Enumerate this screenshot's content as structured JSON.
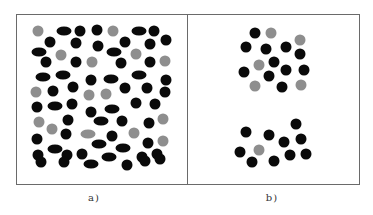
{
  "figure": {
    "frame": {
      "x": 16,
      "y": 14,
      "width": 344,
      "height": 171
    },
    "divider_x": 187,
    "colors": {
      "black": "#0a0a0a",
      "gray": "#8e8e8e",
      "frame": "#6a6a6a"
    },
    "panels": [
      {
        "id": "a",
        "caption": "a)",
        "caption_x": 94,
        "particles": [
          {
            "t": "c",
            "c": "gray",
            "x": 38,
            "y": 31
          },
          {
            "t": "e",
            "c": "black",
            "x": 64,
            "y": 31
          },
          {
            "t": "c",
            "c": "black",
            "x": 80,
            "y": 31
          },
          {
            "t": "c",
            "c": "black",
            "x": 97,
            "y": 30
          },
          {
            "t": "c",
            "c": "gray",
            "x": 113,
            "y": 31
          },
          {
            "t": "e",
            "c": "black",
            "x": 139,
            "y": 31
          },
          {
            "t": "c",
            "c": "black",
            "x": 154,
            "y": 31
          },
          {
            "t": "c",
            "c": "black",
            "x": 50,
            "y": 42
          },
          {
            "t": "c",
            "c": "black",
            "x": 76,
            "y": 43
          },
          {
            "t": "c",
            "c": "black",
            "x": 98,
            "y": 46
          },
          {
            "t": "c",
            "c": "black",
            "x": 125,
            "y": 42
          },
          {
            "t": "c",
            "c": "black",
            "x": 150,
            "y": 44
          },
          {
            "t": "c",
            "c": "black",
            "x": 166,
            "y": 40
          },
          {
            "t": "e",
            "c": "black",
            "x": 39,
            "y": 52
          },
          {
            "t": "c",
            "c": "gray",
            "x": 61,
            "y": 55
          },
          {
            "t": "e",
            "c": "black",
            "x": 114,
            "y": 52
          },
          {
            "t": "c",
            "c": "gray",
            "x": 136,
            "y": 54
          },
          {
            "t": "c",
            "c": "black",
            "x": 46,
            "y": 62
          },
          {
            "t": "c",
            "c": "black",
            "x": 76,
            "y": 62
          },
          {
            "t": "c",
            "c": "gray",
            "x": 92,
            "y": 62
          },
          {
            "t": "c",
            "c": "black",
            "x": 121,
            "y": 63
          },
          {
            "t": "c",
            "c": "black",
            "x": 150,
            "y": 62
          },
          {
            "t": "c",
            "c": "gray",
            "x": 165,
            "y": 61
          },
          {
            "t": "e",
            "c": "black",
            "x": 43,
            "y": 77
          },
          {
            "t": "e",
            "c": "black",
            "x": 63,
            "y": 75
          },
          {
            "t": "c",
            "c": "black",
            "x": 91,
            "y": 80
          },
          {
            "t": "e",
            "c": "black",
            "x": 111,
            "y": 79
          },
          {
            "t": "e",
            "c": "black",
            "x": 139,
            "y": 75
          },
          {
            "t": "c",
            "c": "black",
            "x": 166,
            "y": 80
          },
          {
            "t": "c",
            "c": "gray",
            "x": 36,
            "y": 92
          },
          {
            "t": "c",
            "c": "black",
            "x": 53,
            "y": 91
          },
          {
            "t": "c",
            "c": "black",
            "x": 73,
            "y": 87
          },
          {
            "t": "c",
            "c": "gray",
            "x": 89,
            "y": 95
          },
          {
            "t": "c",
            "c": "gray",
            "x": 106,
            "y": 94
          },
          {
            "t": "c",
            "c": "black",
            "x": 125,
            "y": 88
          },
          {
            "t": "c",
            "c": "black",
            "x": 147,
            "y": 88
          },
          {
            "t": "c",
            "c": "black",
            "x": 37,
            "y": 107
          },
          {
            "t": "e",
            "c": "black",
            "x": 55,
            "y": 106
          },
          {
            "t": "c",
            "c": "black",
            "x": 72,
            "y": 104
          },
          {
            "t": "c",
            "c": "black",
            "x": 91,
            "y": 112
          },
          {
            "t": "e",
            "c": "black",
            "x": 112,
            "y": 109
          },
          {
            "t": "c",
            "c": "black",
            "x": 136,
            "y": 103
          },
          {
            "t": "c",
            "c": "black",
            "x": 155,
            "y": 104
          },
          {
            "t": "c",
            "c": "black",
            "x": 165,
            "y": 92
          },
          {
            "t": "c",
            "c": "gray",
            "x": 39,
            "y": 122
          },
          {
            "t": "c",
            "c": "black",
            "x": 68,
            "y": 120
          },
          {
            "t": "e",
            "c": "black",
            "x": 101,
            "y": 121
          },
          {
            "t": "c",
            "c": "black",
            "x": 122,
            "y": 121
          },
          {
            "t": "c",
            "c": "black",
            "x": 149,
            "y": 123
          },
          {
            "t": "c",
            "c": "gray",
            "x": 163,
            "y": 119
          },
          {
            "t": "c",
            "c": "black",
            "x": 37,
            "y": 139
          },
          {
            "t": "c",
            "c": "gray",
            "x": 52,
            "y": 129
          },
          {
            "t": "c",
            "c": "black",
            "x": 66,
            "y": 134
          },
          {
            "t": "e",
            "c": "gray",
            "x": 88,
            "y": 134
          },
          {
            "t": "c",
            "c": "black",
            "x": 112,
            "y": 136
          },
          {
            "t": "c",
            "c": "gray",
            "x": 134,
            "y": 133
          },
          {
            "t": "c",
            "c": "black",
            "x": 148,
            "y": 143
          },
          {
            "t": "c",
            "c": "gray",
            "x": 163,
            "y": 141
          },
          {
            "t": "c",
            "c": "black",
            "x": 38,
            "y": 155
          },
          {
            "t": "e",
            "c": "black",
            "x": 55,
            "y": 149
          },
          {
            "t": "c",
            "c": "black",
            "x": 67,
            "y": 155
          },
          {
            "t": "c",
            "c": "black",
            "x": 82,
            "y": 154
          },
          {
            "t": "e",
            "c": "black",
            "x": 99,
            "y": 144
          },
          {
            "t": "e",
            "c": "black",
            "x": 109,
            "y": 157
          },
          {
            "t": "e",
            "c": "black",
            "x": 123,
            "y": 148
          },
          {
            "t": "c",
            "c": "black",
            "x": 142,
            "y": 157
          },
          {
            "t": "c",
            "c": "black",
            "x": 157,
            "y": 154
          },
          {
            "t": "c",
            "c": "black",
            "x": 41,
            "y": 162
          },
          {
            "t": "c",
            "c": "black",
            "x": 64,
            "y": 162
          },
          {
            "t": "e",
            "c": "black",
            "x": 91,
            "y": 164
          },
          {
            "t": "c",
            "c": "black",
            "x": 127,
            "y": 165
          },
          {
            "t": "c",
            "c": "black",
            "x": 145,
            "y": 161
          },
          {
            "t": "c",
            "c": "black",
            "x": 160,
            "y": 159
          }
        ]
      },
      {
        "id": "b",
        "caption": "b)",
        "caption_x": 272,
        "particles": [
          {
            "t": "c",
            "c": "black",
            "x": 255,
            "y": 33
          },
          {
            "t": "c",
            "c": "gray",
            "x": 271,
            "y": 33
          },
          {
            "t": "c",
            "c": "gray",
            "x": 300,
            "y": 40
          },
          {
            "t": "c",
            "c": "black",
            "x": 246,
            "y": 47
          },
          {
            "t": "c",
            "c": "black",
            "x": 266,
            "y": 49
          },
          {
            "t": "c",
            "c": "black",
            "x": 286,
            "y": 47
          },
          {
            "t": "c",
            "c": "black",
            "x": 300,
            "y": 54
          },
          {
            "t": "c",
            "c": "black",
            "x": 274,
            "y": 62
          },
          {
            "t": "c",
            "c": "gray",
            "x": 259,
            "y": 65
          },
          {
            "t": "c",
            "c": "black",
            "x": 244,
            "y": 72
          },
          {
            "t": "c",
            "c": "black",
            "x": 286,
            "y": 70
          },
          {
            "t": "c",
            "c": "black",
            "x": 304,
            "y": 70
          },
          {
            "t": "c",
            "c": "black",
            "x": 269,
            "y": 76
          },
          {
            "t": "c",
            "c": "gray",
            "x": 255,
            "y": 86
          },
          {
            "t": "c",
            "c": "black",
            "x": 282,
            "y": 87
          },
          {
            "t": "c",
            "c": "gray",
            "x": 301,
            "y": 85
          },
          {
            "t": "c",
            "c": "black",
            "x": 296,
            "y": 124
          },
          {
            "t": "c",
            "c": "black",
            "x": 246,
            "y": 132
          },
          {
            "t": "c",
            "c": "black",
            "x": 269,
            "y": 135
          },
          {
            "t": "c",
            "c": "black",
            "x": 284,
            "y": 142
          },
          {
            "t": "c",
            "c": "black",
            "x": 301,
            "y": 139
          },
          {
            "t": "c",
            "c": "black",
            "x": 240,
            "y": 152
          },
          {
            "t": "c",
            "c": "gray",
            "x": 259,
            "y": 150
          },
          {
            "t": "c",
            "c": "black",
            "x": 290,
            "y": 155
          },
          {
            "t": "c",
            "c": "black",
            "x": 306,
            "y": 154
          },
          {
            "t": "c",
            "c": "black",
            "x": 252,
            "y": 162
          },
          {
            "t": "c",
            "c": "black",
            "x": 274,
            "y": 161
          }
        ]
      }
    ]
  }
}
